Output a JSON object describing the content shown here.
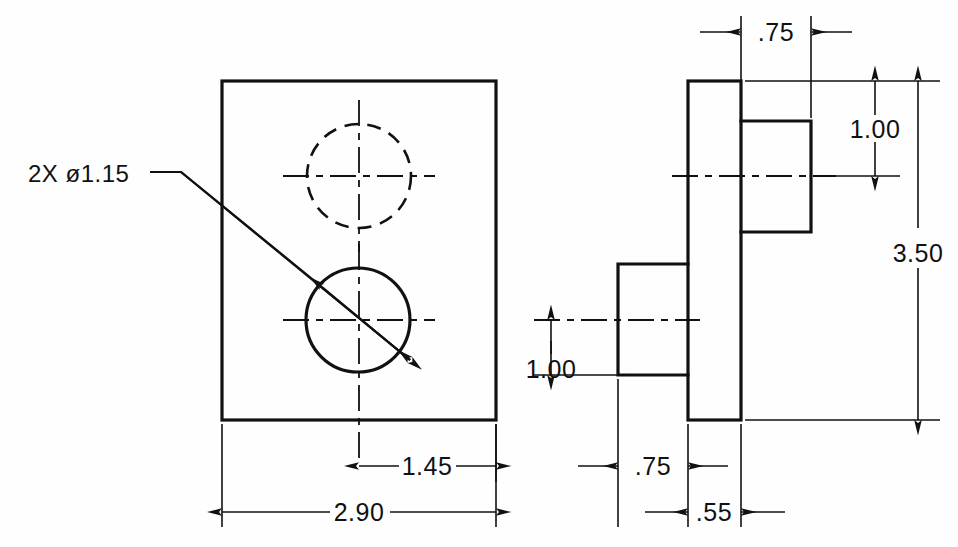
{
  "drawing": {
    "title": "two-view orthographic part drawing",
    "units_note": "",
    "line_color": "#111111",
    "background": "#fefefe"
  },
  "callouts": [
    {
      "id": "hole-callout",
      "text": "2X  ø1.15",
      "quantity": "2X",
      "symbol": "ø",
      "value": "1.15",
      "x": 28,
      "y": 182
    }
  ],
  "dimensions": [
    {
      "id": "front-width-overall",
      "label": "2.90",
      "x": 359,
      "y": 505,
      "view": "front",
      "orientation": "horizontal"
    },
    {
      "id": "front-hole-center-to-edge",
      "label": "1.45",
      "x": 427,
      "y": 459,
      "view": "front",
      "orientation": "horizontal"
    },
    {
      "id": "side-top-boss-depth",
      "label": ".75",
      "x": 776,
      "y": 25,
      "view": "side",
      "orientation": "horizontal"
    },
    {
      "id": "side-bottom-boss-depth",
      "label": ".75",
      "x": 653,
      "y": 459,
      "view": "side",
      "orientation": "horizontal"
    },
    {
      "id": "side-plate-thickness",
      "label": ".55",
      "x": 714,
      "y": 505,
      "view": "side",
      "orientation": "horizontal"
    },
    {
      "id": "side-top-boss-height",
      "label": "1.00",
      "x": 875,
      "y": 129,
      "view": "side",
      "orientation": "vertical"
    },
    {
      "id": "side-bottom-boss-height",
      "label": "1.00",
      "x": 551,
      "y": 369,
      "view": "side",
      "orientation": "vertical"
    },
    {
      "id": "side-overall-height",
      "label": "3.50",
      "x": 918,
      "y": 253,
      "view": "side",
      "orientation": "vertical"
    }
  ],
  "views": {
    "front": {
      "name": "front-view",
      "plate": {
        "x": 222,
        "y": 81,
        "width": 274,
        "height": 339
      },
      "holes": [
        {
          "id": "upper-hole",
          "style": "hidden",
          "cx": 359,
          "cy": 176,
          "r": 52
        },
        {
          "id": "lower-hole",
          "style": "visible",
          "cx": 358,
          "cy": 320,
          "r": 52
        }
      ]
    },
    "side": {
      "name": "right-side-view",
      "plate": {
        "x": 688,
        "y": 81,
        "width": 53,
        "height": 339
      },
      "bosses": [
        {
          "id": "upper-boss",
          "x": 741,
          "y": 121,
          "width": 70,
          "height": 111
        },
        {
          "id": "lower-boss",
          "x": 618,
          "y": 264,
          "width": 70,
          "height": 111
        }
      ]
    }
  }
}
